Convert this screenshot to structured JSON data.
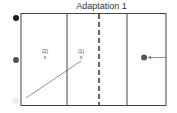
{
  "title": "Adaptation 1",
  "markers": [
    {
      "label": "(2)",
      "symbol": "x"
    },
    {
      "label": "(1)",
      "symbol": "x"
    }
  ],
  "colors": {
    "line": "#555555",
    "dot_black": "#1a1a1a",
    "dot_grey": "#555555",
    "dot_light": "#e6e6e6"
  }
}
